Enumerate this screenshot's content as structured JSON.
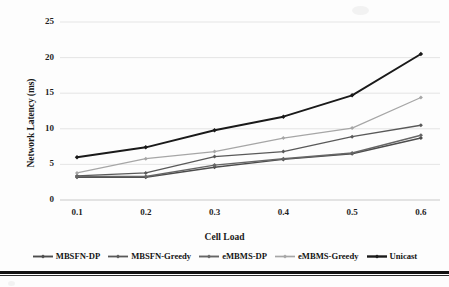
{
  "chart_data": {
    "type": "line",
    "title": "",
    "xlabel": "Cell Load",
    "ylabel": "Network Latency (ms)",
    "categories": [
      "0.1",
      "0.2",
      "0.3",
      "0.4",
      "0.5",
      "0.6"
    ],
    "x": [
      0.1,
      0.2,
      0.3,
      0.4,
      0.5,
      0.6
    ],
    "xlim": [
      0.1,
      0.6
    ],
    "ylim": [
      0,
      25
    ],
    "yticks": [
      "0",
      "5",
      "10",
      "15",
      "20",
      "25"
    ],
    "ytick_values": [
      0,
      5,
      10,
      15,
      20,
      25
    ],
    "grid": "horizontal",
    "legend_position": "bottom",
    "series": [
      {
        "name": "MBSFN-DP",
        "values": [
          3.2,
          3.2,
          4.6,
          5.7,
          6.5,
          8.7
        ],
        "color": "#4d4d4d",
        "marker": "diamond",
        "width": 1.4
      },
      {
        "name": "MBSFN-Greedy",
        "values": [
          3.4,
          3.8,
          6.1,
          6.8,
          8.9,
          10.5
        ],
        "color": "#595959",
        "marker": "diamond",
        "width": 1.3
      },
      {
        "name": "eMBMS-DP",
        "values": [
          3.3,
          3.3,
          4.9,
          5.8,
          6.6,
          9.1
        ],
        "color": "#666666",
        "marker": "diamond",
        "width": 1.4
      },
      {
        "name": "eMBMS-Greedy",
        "values": [
          3.8,
          5.8,
          6.8,
          8.7,
          10.1,
          14.4
        ],
        "color": "#a6a6a6",
        "marker": "diamond",
        "width": 1.2
      },
      {
        "name": "Unicast",
        "values": [
          6.0,
          7.4,
          9.8,
          11.7,
          14.7,
          20.5
        ],
        "color": "#1a1a1a",
        "marker": "diamond",
        "width": 1.9
      }
    ],
    "colors": {
      "grid": "#e2e2e2",
      "axis": "#d0d0d0",
      "text": "#1a1a1a",
      "background": "#fdfdfd"
    }
  }
}
